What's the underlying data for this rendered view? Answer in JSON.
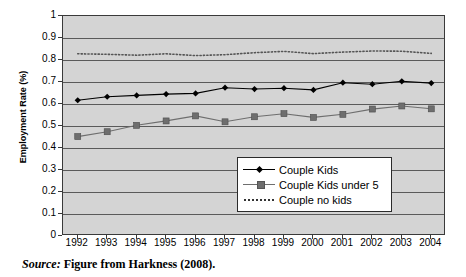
{
  "figure": {
    "source_prefix": "Source:",
    "source_text": " Figure from Harkness (2008)."
  },
  "chart_data": {
    "type": "line",
    "title": "",
    "xlabel": "",
    "ylabel": "Employment Rate (%)",
    "ylim": [
      0,
      1
    ],
    "ytick_labels": [
      "0",
      "0.1",
      "0.2",
      "0.3",
      "0.4",
      "0.5",
      "0.6",
      "0.7",
      "0.8",
      "0.9",
      "1"
    ],
    "ytick_values": [
      0,
      0.1,
      0.2,
      0.3,
      0.4,
      0.5,
      0.6,
      0.7,
      0.8,
      0.9,
      1
    ],
    "grid": true,
    "legend_position": "inside-bottom-right",
    "categories": [
      "1992",
      "1993",
      "1994",
      "1995",
      "1996",
      "1997",
      "1998",
      "1999",
      "2000",
      "2001",
      "2002",
      "2003",
      "2004"
    ],
    "series": [
      {
        "name": "Couple Kids",
        "marker": "diamond",
        "color": "#000000",
        "style": "solid",
        "values": [
          0.617,
          0.633,
          0.639,
          0.645,
          0.648,
          0.674,
          0.668,
          0.672,
          0.664,
          0.697,
          0.69,
          0.703,
          0.695
        ]
      },
      {
        "name": "Couple Kids under 5",
        "marker": "square",
        "color": "#6e6e6e",
        "style": "solid",
        "values": [
          0.452,
          0.474,
          0.503,
          0.523,
          0.546,
          0.519,
          0.542,
          0.556,
          0.539,
          0.553,
          0.577,
          0.591,
          0.578
        ]
      },
      {
        "name": "Couple no kids",
        "marker": "none",
        "color": "#555555",
        "style": "dotted",
        "values": [
          0.828,
          0.826,
          0.822,
          0.828,
          0.82,
          0.824,
          0.833,
          0.839,
          0.829,
          0.836,
          0.841,
          0.84,
          0.83
        ]
      }
    ]
  },
  "legend": {
    "items": [
      {
        "label": "Couple Kids"
      },
      {
        "label": "Couple Kids under 5"
      },
      {
        "label": "Couple no kids"
      }
    ]
  }
}
